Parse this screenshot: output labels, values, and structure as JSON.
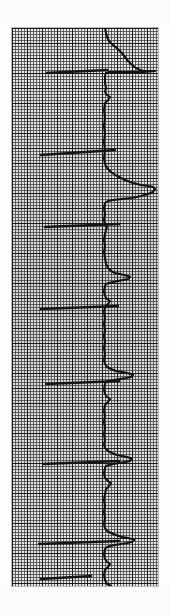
{
  "document": {
    "kind": "ecg-rhythm-strip",
    "orientation": "rotated-90-degrees",
    "caption": "ECG rhythm strip on graph paper"
  },
  "paper": {
    "label": "ECG graph paper",
    "background_color": "#dcdcdc",
    "minor_grid_color": "#373737",
    "major_grid_color": "#141414",
    "minor_grid_spacing_px": 3,
    "major_grid_spacing_px": 15,
    "left_px": 12,
    "top_px": 28,
    "width_px": 146,
    "height_px": 558
  },
  "trace": {
    "label": "ECG waveform trace",
    "color": "#121212",
    "stroke_width_px": 2.1,
    "baseline_x_px": 92,
    "beats": 7
  },
  "markers": {
    "label": "lead transition marker lines",
    "color": "#151515",
    "lines": [
      {
        "x1": 34,
        "y1": 45,
        "x2": 96,
        "y2": 42
      },
      {
        "x1": 28,
        "y1": 127,
        "x2": 104,
        "y2": 122
      },
      {
        "x1": 32,
        "y1": 199,
        "x2": 108,
        "y2": 196
      },
      {
        "x1": 28,
        "y1": 281,
        "x2": 107,
        "y2": 278
      },
      {
        "x1": 33,
        "y1": 356,
        "x2": 108,
        "y2": 353
      },
      {
        "x1": 30,
        "y1": 436,
        "x2": 108,
        "y2": 433
      },
      {
        "x1": 26,
        "y1": 516,
        "x2": 108,
        "y2": 513
      },
      {
        "x1": 28,
        "y1": 551,
        "x2": 80,
        "y2": 548
      }
    ]
  },
  "chart_data": {
    "type": "line",
    "title": "ECG rhythm strip",
    "subtitle": "Rotated 90 degrees; time runs top to bottom, amplitude left to right",
    "xlabel": "Amplitude (mV)",
    "ylabel": "Time (s)",
    "grid": true,
    "legend": "none",
    "paper_speed": "25 mm/s",
    "calibration": "10 mm/mV",
    "small_box_mm": 1,
    "large_box_mm": 5,
    "baseline_amplitude_px": 92,
    "series": [
      {
        "name": "ECG lead trace",
        "orientation": "vertical",
        "points": [
          [
            93,
            0
          ],
          [
            94,
            5
          ],
          [
            95,
            9
          ],
          [
            97,
            13
          ],
          [
            101,
            17
          ],
          [
            106,
            21
          ],
          [
            110,
            25
          ],
          [
            113,
            29
          ],
          [
            116,
            33
          ],
          [
            120,
            37
          ],
          [
            124,
            40
          ],
          [
            128,
            42
          ],
          [
            132,
            43
          ],
          [
            136,
            43
          ],
          [
            140,
            43
          ],
          [
            143,
            43
          ],
          [
            132,
            44
          ],
          [
            120,
            44
          ],
          [
            110,
            44
          ],
          [
            102,
            44
          ],
          [
            97,
            44
          ],
          [
            94,
            45
          ],
          [
            93,
            48
          ],
          [
            93,
            55
          ],
          [
            94,
            60
          ],
          [
            93,
            64
          ],
          [
            95,
            67
          ],
          [
            98,
            69
          ],
          [
            96,
            72
          ],
          [
            93,
            75
          ],
          [
            92,
            82
          ],
          [
            93,
            90
          ],
          [
            92,
            98
          ],
          [
            93,
            106
          ],
          [
            92,
            114
          ],
          [
            93,
            122
          ],
          [
            92,
            130
          ],
          [
            93,
            136
          ],
          [
            95,
            140
          ],
          [
            99,
            144
          ],
          [
            105,
            148
          ],
          [
            113,
            152
          ],
          [
            121,
            155
          ],
          [
            129,
            157
          ],
          [
            136,
            158
          ],
          [
            141,
            159
          ],
          [
            143,
            161
          ],
          [
            141,
            164
          ],
          [
            136,
            166
          ],
          [
            129,
            168
          ],
          [
            120,
            170
          ],
          [
            110,
            171
          ],
          [
            101,
            172
          ],
          [
            96,
            173
          ],
          [
            93,
            175
          ],
          [
            92,
            180
          ],
          [
            93,
            186
          ],
          [
            92,
            192
          ],
          [
            93,
            197
          ],
          [
            95,
            199
          ],
          [
            94,
            202
          ],
          [
            93,
            206
          ],
          [
            92,
            212
          ],
          [
            93,
            218
          ],
          [
            92,
            224
          ],
          [
            93,
            230
          ],
          [
            94,
            236
          ],
          [
            96,
            240
          ],
          [
            99,
            243
          ],
          [
            103,
            245
          ],
          [
            108,
            246
          ],
          [
            112,
            247
          ],
          [
            116,
            248
          ],
          [
            118,
            249
          ],
          [
            116,
            251
          ],
          [
            111,
            252
          ],
          [
            106,
            253
          ],
          [
            101,
            254
          ],
          [
            97,
            255
          ],
          [
            94,
            256
          ],
          [
            93,
            258
          ],
          [
            92,
            263
          ],
          [
            93,
            268
          ],
          [
            95,
            271
          ],
          [
            98,
            273
          ],
          [
            96,
            276
          ],
          [
            93,
            279
          ],
          [
            92,
            284
          ],
          [
            93,
            290
          ],
          [
            92,
            296
          ],
          [
            93,
            302
          ],
          [
            92,
            308
          ],
          [
            93,
            314
          ],
          [
            92,
            320
          ],
          [
            93,
            326
          ],
          [
            92,
            332
          ],
          [
            93,
            336
          ],
          [
            95,
            339
          ],
          [
            99,
            341
          ],
          [
            104,
            343
          ],
          [
            110,
            344
          ],
          [
            115,
            345
          ],
          [
            119,
            346
          ],
          [
            121,
            347
          ],
          [
            119,
            349
          ],
          [
            114,
            350
          ],
          [
            108,
            351
          ],
          [
            102,
            352
          ],
          [
            97,
            353
          ],
          [
            94,
            354
          ],
          [
            93,
            356
          ],
          [
            92,
            361
          ],
          [
            93,
            366
          ],
          [
            95,
            369
          ],
          [
            98,
            371
          ],
          [
            96,
            374
          ],
          [
            93,
            377
          ],
          [
            92,
            382
          ],
          [
            93,
            388
          ],
          [
            92,
            394
          ],
          [
            93,
            400
          ],
          [
            92,
            406
          ],
          [
            93,
            412
          ],
          [
            92,
            417
          ],
          [
            93,
            420
          ],
          [
            96,
            423
          ],
          [
            100,
            425
          ],
          [
            105,
            427
          ],
          [
            110,
            428
          ],
          [
            115,
            429
          ],
          [
            118,
            430
          ],
          [
            120,
            431
          ],
          [
            118,
            433
          ],
          [
            113,
            434
          ],
          [
            107,
            435
          ],
          [
            101,
            436
          ],
          [
            97,
            437
          ],
          [
            94,
            438
          ],
          [
            93,
            440
          ],
          [
            92,
            445
          ],
          [
            93,
            450
          ],
          [
            96,
            453
          ],
          [
            99,
            455
          ],
          [
            97,
            458
          ],
          [
            94,
            461
          ],
          [
            93,
            466
          ],
          [
            92,
            472
          ],
          [
            93,
            478
          ],
          [
            92,
            484
          ],
          [
            93,
            490
          ],
          [
            92,
            496
          ],
          [
            93,
            500
          ],
          [
            95,
            503
          ],
          [
            99,
            505
          ],
          [
            104,
            507
          ],
          [
            110,
            509
          ],
          [
            116,
            510
          ],
          [
            120,
            511
          ],
          [
            122,
            512
          ],
          [
            120,
            514
          ],
          [
            115,
            515
          ],
          [
            109,
            516
          ],
          [
            103,
            517
          ],
          [
            98,
            518
          ],
          [
            95,
            519
          ],
          [
            93,
            521
          ],
          [
            92,
            526
          ],
          [
            93,
            531
          ],
          [
            95,
            534
          ],
          [
            98,
            536
          ],
          [
            96,
            539
          ],
          [
            93,
            542
          ],
          [
            92,
            547
          ],
          [
            93,
            552
          ],
          [
            95,
            556
          ],
          [
            99,
            558
          ]
        ]
      }
    ]
  }
}
